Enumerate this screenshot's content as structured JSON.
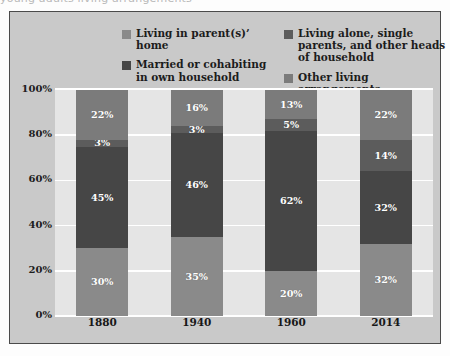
{
  "clipped_headline": "young adults living arrangements",
  "chart_data": {
    "type": "bar",
    "subtype": "stacked-100-percent",
    "title": "",
    "subtitle": "",
    "xlabel": "",
    "ylabel": "",
    "ylim": [
      0,
      100
    ],
    "ytick_labels": [
      "0%",
      "20%",
      "40%",
      "60%",
      "80%",
      "100%"
    ],
    "ytick_values": [
      0,
      20,
      40,
      60,
      80,
      100
    ],
    "grid": true,
    "grid_color": "#ffffff",
    "legend_position": "top",
    "plot_background": "#e5e5e5",
    "card_background": "#c9c9c9",
    "categories": [
      "1880",
      "1940",
      "1960",
      "2014"
    ],
    "series": [
      {
        "name": "Living in parent(s)' home",
        "color": "#8a8a8a",
        "values": [
          30,
          35,
          20,
          32
        ],
        "labels": [
          "30%",
          "35%",
          "20%",
          "32%"
        ]
      },
      {
        "name": "Married or cohabiting in own household",
        "color": "#464646",
        "values": [
          45,
          46,
          62,
          32
        ],
        "labels": [
          "45%",
          "46%",
          "62%",
          "32%"
        ]
      },
      {
        "name": "Living alone, single parents, and other heads of household",
        "color": "#5c5c5c",
        "values": [
          3,
          3,
          5,
          14
        ],
        "labels": [
          "3%",
          "3%",
          "5%",
          "14%"
        ]
      },
      {
        "name": "Other living arrangements",
        "color": "#7b7b7b",
        "values": [
          22,
          16,
          13,
          22
        ],
        "labels": [
          "22%",
          "16%",
          "13%",
          "22%"
        ]
      }
    ]
  },
  "legend": {
    "items": [
      {
        "label": "Living in parent(s)’ home",
        "color": "#8a8a8a"
      },
      {
        "label": "Living alone, single parents, and other heads of household",
        "color": "#5c5c5c"
      },
      {
        "label": "Married or cohabiting in own household",
        "color": "#464646"
      },
      {
        "label": "Other living arrangements",
        "color": "#7b7b7b"
      }
    ]
  }
}
